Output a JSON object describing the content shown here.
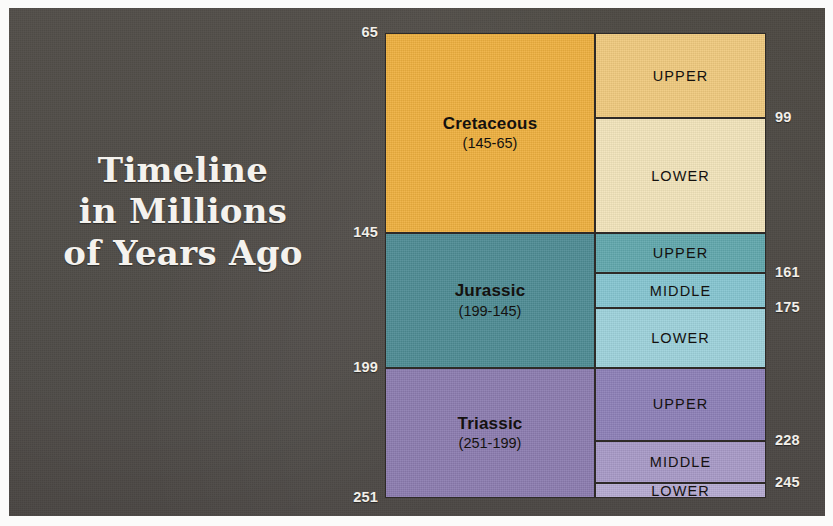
{
  "poster": {
    "title_lines": [
      "Timeline",
      "in Millions",
      "of Years Ago"
    ],
    "background_color": "#4a4641",
    "title_color": "#f4f2ee"
  },
  "chart_data": {
    "type": "bar",
    "xlabel": "",
    "ylabel": "Millions of Years Ago",
    "ylim": [
      65,
      251
    ],
    "axis_inverted": true,
    "grid": false,
    "legend": "none",
    "unit": "million years ago",
    "left_axis_ticks": [
      "65",
      "145",
      "199",
      "251"
    ],
    "right_axis_ticks": [
      "99",
      "161",
      "175",
      "228",
      "245"
    ],
    "all_boundaries": [
      65,
      99,
      145,
      161,
      175,
      199,
      228,
      245,
      251
    ],
    "columns": [
      "Period",
      "Epoch"
    ],
    "periods": [
      {
        "name": "Cretaceous",
        "range_label": "(145-65)",
        "start": 145,
        "end": 65,
        "duration": 80,
        "color": "#eeb03f",
        "epochs": [
          {
            "name": "UPPER",
            "start": 99,
            "end": 65,
            "duration": 34,
            "color": "#f0ca7e"
          },
          {
            "name": "LOWER",
            "start": 145,
            "end": 99,
            "duration": 46,
            "color": "#f2e4bb"
          }
        ]
      },
      {
        "name": "Jurassic",
        "range_label": "(199-145)",
        "start": 199,
        "end": 145,
        "duration": 54,
        "color": "#4e8c94",
        "epochs": [
          {
            "name": "UPPER",
            "start": 161,
            "end": 145,
            "duration": 16,
            "color": "#61a8ad"
          },
          {
            "name": "MIDDLE",
            "start": 175,
            "end": 161,
            "duration": 14,
            "color": "#86c6d1"
          },
          {
            "name": "LOWER",
            "start": 199,
            "end": 175,
            "duration": 24,
            "color": "#9ed2dc"
          }
        ]
      },
      {
        "name": "Triassic",
        "range_label": "(251-199)",
        "start": 251,
        "end": 199,
        "duration": 52,
        "color": "#8c7cb0",
        "epochs": [
          {
            "name": "UPPER",
            "start": 228,
            "end": 199,
            "duration": 29,
            "color": "#8d80b8"
          },
          {
            "name": "MIDDLE",
            "start": 245,
            "end": 228,
            "duration": 17,
            "color": "#a89ac7"
          },
          {
            "name": "LOWER",
            "start": 251,
            "end": 245,
            "duration": 6,
            "color": "#b6abd2"
          }
        ]
      }
    ]
  }
}
